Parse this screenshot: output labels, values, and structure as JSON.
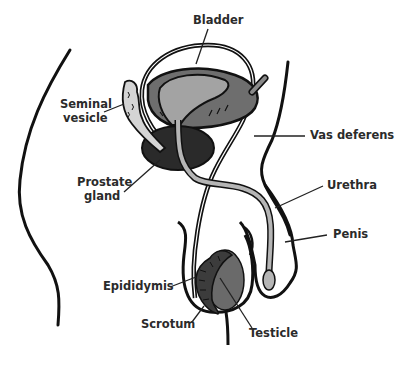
{
  "diagram": {
    "labels": {
      "bladder": "Bladder",
      "seminal_vesicle_1": "Seminal",
      "seminal_vesicle_2": "vesicle",
      "vas_deferens": "Vas deferens",
      "prostate_1": "Prostate",
      "prostate_2": "gland",
      "urethra": "Urethra",
      "penis": "Penis",
      "epididymis": "Epididymis",
      "scrotum": "Scrotum",
      "testicle": "Testicle"
    },
    "colors": {
      "outline": "#111111",
      "bladder_inner": "#a3a3a3",
      "bladder_wall": "#6e6e6e",
      "prostate": "#2a2a2a",
      "urethra": "#b5b5b5",
      "testicle": "#6a6a6a",
      "epididymis": "#3c3c3c",
      "seminal_vesicle": "#d4d4d4",
      "text": "#2b2b2b"
    }
  }
}
